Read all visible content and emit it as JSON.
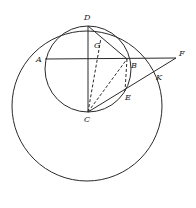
{
  "diagram": {
    "type": "geometric-construction",
    "labels": {
      "A": "A",
      "B": "B",
      "C": "C",
      "D": "D",
      "E": "E",
      "F": "F",
      "G": "G",
      "K": "K"
    },
    "elements": {
      "circles": [
        "small circle through D, B, E, C, A",
        "large circle through A, K"
      ],
      "solid_segments": [
        "D-C",
        "A-F",
        "D-B",
        "C-F"
      ],
      "dashed_segments": [
        "C-G",
        "C-B",
        "B-E"
      ]
    },
    "stroke_color": "#2a2a2a",
    "background": "#ffffff"
  }
}
